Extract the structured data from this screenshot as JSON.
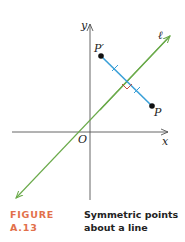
{
  "figure": {
    "axes": {
      "x_label": "x",
      "y_label": "y",
      "origin_label": "O"
    },
    "line": {
      "label": "ℓ",
      "color": "#6aaa4a"
    },
    "segment": {
      "color": "#3aa0d8"
    },
    "points": [
      {
        "label": "P′",
        "x": 101,
        "y": 56
      },
      {
        "label": "P",
        "x": 152,
        "y": 106
      }
    ],
    "axis_color": "#555555",
    "point_color": "#111111"
  },
  "caption": {
    "number": "FIGURE A.13",
    "text": "Symmetric points about a line",
    "number_color": "#e2704a"
  }
}
